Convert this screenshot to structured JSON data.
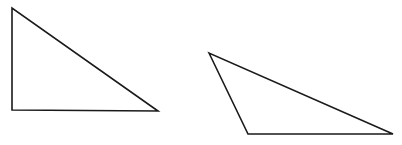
{
  "diagram": {
    "background": "#ffffff",
    "stroke_color": "#1a1a1a",
    "stroke_width": 1.6,
    "shapes": [
      {
        "name": "right-triangle",
        "type": "triangle",
        "points": "12,8 12,110 158,111"
      },
      {
        "name": "obtuse-triangle",
        "type": "triangle",
        "points": "209,53 248,134 393,134"
      }
    ]
  }
}
